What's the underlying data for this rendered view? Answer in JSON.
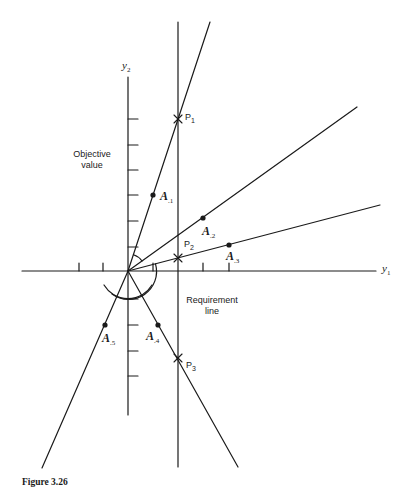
{
  "figure": {
    "caption": "Figure 3.26",
    "axes": {
      "horizontal": {
        "label": "y",
        "subscript": "1"
      },
      "vertical": {
        "label": "y",
        "subscript": "2"
      }
    },
    "annotations": {
      "objective_line1": "Objective",
      "objective_line2": "value",
      "requirement_line1": "Requirement",
      "requirement_line2": "line"
    },
    "points": [
      {
        "label": "P",
        "subscript": "1"
      },
      {
        "label": "P",
        "subscript": "2"
      },
      {
        "label": "P",
        "subscript": "3"
      }
    ],
    "vectors": [
      {
        "label": "A",
        "subscript": ".1"
      },
      {
        "label": "A",
        "subscript": ".2"
      },
      {
        "label": "A",
        "subscript": ".3"
      },
      {
        "label": "A",
        "subscript": ".4"
      },
      {
        "label": "A",
        "subscript": ".5"
      }
    ],
    "colors": {
      "ink": "#1a1a1a",
      "background": "#ffffff"
    }
  }
}
